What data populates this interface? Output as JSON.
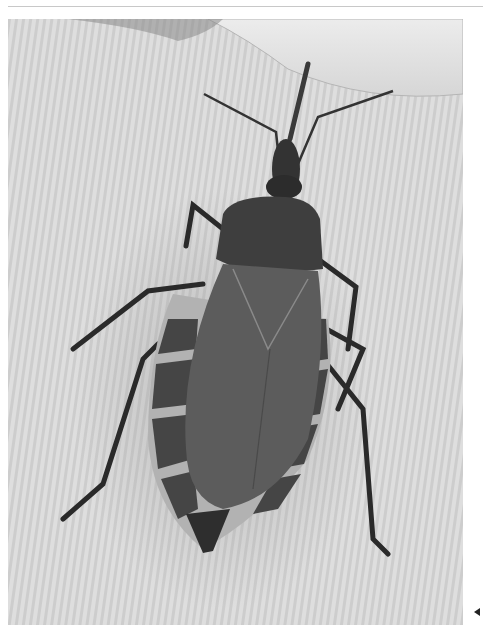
{
  "image": {
    "subject": "kissing bug (triatomine insect) on textured fabric, dorsal view, grayscale",
    "alt": "Grayscale photograph of a triatomine kissing bug seen from above, resting on ribbed fabric near a fingertip",
    "colors": {
      "background_fabric": "#dcdcdc",
      "fabric_stripe": "#cfcfcf",
      "finger": "#e6e6e6",
      "body_dark": "#3a3a3a",
      "wing": "#5e5e5e",
      "connexivum_light": "#b0b0b0",
      "legs": "#2a2a2a"
    }
  },
  "ui": {
    "separator": "top-rule",
    "nav_arrow": "previous-arrow"
  }
}
